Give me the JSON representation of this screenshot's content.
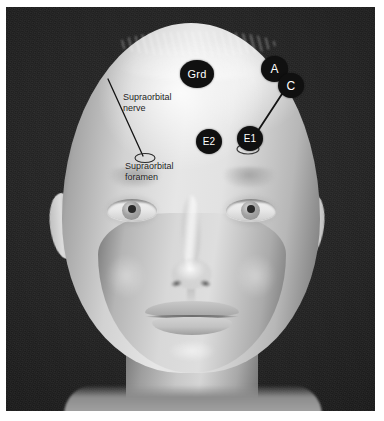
{
  "figure": {
    "background_color": "#222222",
    "frame_color": "#ffffff",
    "marker_fill": "#101010",
    "marker_text_color": "#ffffff",
    "annotation_text_color": "#1a1a1a",
    "leader_line_color": "#141414"
  },
  "electrodes": [
    {
      "id": "grd",
      "label": "Grd",
      "name": "ground-electrode-marker",
      "x": 174,
      "y": 53,
      "w": 34,
      "h": 28,
      "font_size": 11
    },
    {
      "id": "a",
      "label": "A",
      "name": "anode-electrode-marker",
      "x": 255,
      "y": 49,
      "w": 27,
      "h": 26,
      "font_size": 12
    },
    {
      "id": "c",
      "label": "C",
      "name": "cathode-electrode-marker",
      "x": 272,
      "y": 66,
      "w": 26,
      "h": 25,
      "font_size": 12
    },
    {
      "id": "e2",
      "label": "E2",
      "name": "reference-electrode-marker",
      "x": 190,
      "y": 122,
      "w": 26,
      "h": 25,
      "font_size": 10
    },
    {
      "id": "e1",
      "label": "E1",
      "name": "active-electrode-marker",
      "x": 231,
      "y": 119,
      "w": 26,
      "h": 25,
      "font_size": 10
    }
  ],
  "annotations": [
    {
      "id": "nerve",
      "name": "supraorbital-nerve-label",
      "text": "Supraorbital\nnerve",
      "x": 117,
      "y": 85
    },
    {
      "id": "foramen",
      "name": "supraorbital-foramen-label",
      "text": "Supraorbital\nforamen",
      "x": 119,
      "y": 154
    }
  ],
  "leader_lines": [
    {
      "id": "nerve-leader",
      "name": "supraorbital-nerve-leader-line",
      "x1": 102,
      "y1": 72,
      "x2": 137,
      "y2": 149
    },
    {
      "id": "stimulator-leader",
      "name": "stimulator-cable-line",
      "x1": 276,
      "y1": 87,
      "x2": 242,
      "y2": 139
    }
  ],
  "foramen_ellipse": {
    "name": "supraorbital-foramen-ellipse",
    "cx": 139,
    "cy": 151,
    "rx": 10,
    "ry": 4.5
  },
  "electrode_pad": {
    "name": "electrode-pad-outline",
    "cx": 242,
    "cy": 142,
    "rx": 11,
    "ry": 5
  }
}
